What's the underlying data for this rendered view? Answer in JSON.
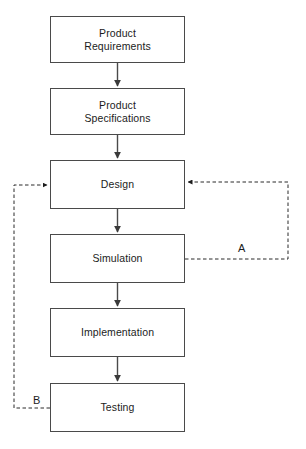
{
  "diagram": {
    "type": "flowchart",
    "orientation": "vertical",
    "stroke_color": "#4a4a4a",
    "text_color": "#1c1c1c",
    "background_color": "#ffffff",
    "nodes": [
      {
        "id": "requirements",
        "label": "Product\nRequirements",
        "x": 50,
        "y": 16,
        "w": 135,
        "h": 47
      },
      {
        "id": "specifications",
        "label": "Product\nSpecifications",
        "x": 50,
        "y": 88,
        "w": 135,
        "h": 47
      },
      {
        "id": "design",
        "label": "Design",
        "x": 50,
        "y": 160,
        "w": 135,
        "h": 49
      },
      {
        "id": "simulation",
        "label": "Simulation",
        "x": 50,
        "y": 234,
        "w": 135,
        "h": 49
      },
      {
        "id": "implementation",
        "label": "Implementation",
        "x": 50,
        "y": 308,
        "w": 135,
        "h": 49
      },
      {
        "id": "testing",
        "label": "Testing",
        "x": 50,
        "y": 383,
        "w": 135,
        "h": 49
      }
    ],
    "edges": [
      {
        "from": "requirements",
        "to": "specifications",
        "style": "solid",
        "label": ""
      },
      {
        "from": "specifications",
        "to": "design",
        "style": "solid",
        "label": ""
      },
      {
        "from": "design",
        "to": "simulation",
        "style": "solid",
        "label": ""
      },
      {
        "from": "simulation",
        "to": "implementation",
        "style": "solid",
        "label": ""
      },
      {
        "from": "implementation",
        "to": "testing",
        "style": "solid",
        "label": ""
      },
      {
        "from": "simulation",
        "to": "design",
        "style": "dashed",
        "label": "A",
        "side": "right"
      },
      {
        "from": "testing",
        "to": "design",
        "style": "dashed",
        "label": "B",
        "side": "left"
      }
    ],
    "loop_labels": [
      {
        "id": "loop-a",
        "text": "A",
        "x": 236,
        "y": 242
      },
      {
        "id": "loop-b",
        "text": "B",
        "x": 31,
        "y": 394
      }
    ]
  }
}
